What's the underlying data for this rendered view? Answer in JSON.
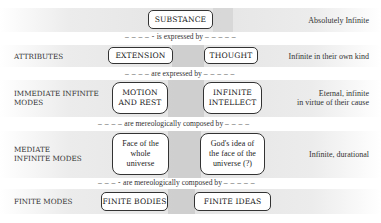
{
  "diagram": {
    "levels": [
      {
        "label": "",
        "boxes": [
          "SUBSTANCE"
        ],
        "description": "Absolutely Infinite"
      },
      {
        "label": "ATTRIBUTES",
        "boxes": [
          "EXTENSION",
          "THOUGHT"
        ],
        "description": "Infinite in their own kind"
      },
      {
        "label_line1": "IMMEDIATE INFINITE",
        "label_line2": "MODES",
        "boxes": [
          {
            "line1": "MOTION",
            "line2": "AND REST"
          },
          {
            "line1": "INFINITE",
            "line2": "INTELLECT"
          }
        ],
        "description_line1": "Eternal, infinite",
        "description_line2": "in virtue of their cause"
      },
      {
        "label_line1": "MEDIATE",
        "label_line2": "INFINITE MODES",
        "boxes": [
          {
            "line1": "Face of the",
            "line2": "whole",
            "line3": "universe"
          },
          {
            "line1": "God's idea of",
            "line2": "the face of the",
            "line3": "universe (?)"
          }
        ],
        "description": "Infinite, durational"
      },
      {
        "label": "FINITE MODES",
        "boxes": [
          "FINITE BODIES",
          "FINITE IDEAS"
        ],
        "description": ""
      }
    ],
    "connectors": [
      {
        "dashes_left": "– – – – -",
        "text": "is expressed by",
        "dashes_right": "– – – – –"
      },
      {
        "dashes_left": "– – – –",
        "text": "are expressed by",
        "dashes_right": "– – – – –"
      },
      {
        "dashes_left": "– – – –",
        "text": "are mereologically composed by",
        "dashes_right": "– – – –"
      },
      {
        "dashes_left": "– – – -",
        "text": "are mereologically composed by",
        "dashes_right": "– – – – –"
      }
    ]
  }
}
